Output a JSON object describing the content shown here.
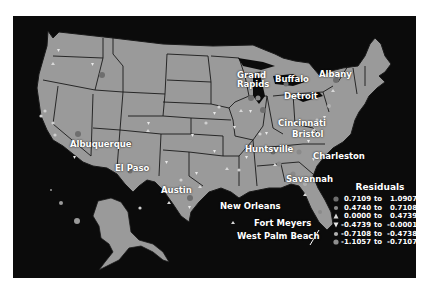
{
  "map": {
    "title": "Residuals map of the United States",
    "colors": {
      "background": "#0b0b0b",
      "land": "#9a9a9a",
      "border": "#1a1a1a",
      "text": "#ffffff"
    },
    "cities": [
      {
        "name": "Grand Rapids",
        "line1": "Grand",
        "line2": "Rapids"
      },
      {
        "name": "Buffalo"
      },
      {
        "name": "Albany"
      },
      {
        "name": "Detroit"
      },
      {
        "name": "Cincinnati"
      },
      {
        "name": "Bristol"
      },
      {
        "name": "Charleston"
      },
      {
        "name": "Huntsville"
      },
      {
        "name": "Savannah"
      },
      {
        "name": "Albuquerque"
      },
      {
        "name": "El Paso"
      },
      {
        "name": "Austin"
      },
      {
        "name": "New Orleans"
      },
      {
        "name": "Fort Meyers"
      },
      {
        "name": "West Palm Beach"
      }
    ]
  },
  "legend": {
    "title": "Residuals",
    "rows": [
      {
        "symbol": "circle-large",
        "color": "#6e6e6e",
        "from": "0.7109",
        "to_label": "to",
        "to": "1.0907"
      },
      {
        "symbol": "circle-medium",
        "color": "#8a8a8a",
        "from": "0.4740",
        "to_label": "to",
        "to": "0.7108"
      },
      {
        "symbol": "triangle-up",
        "color": "#d8d8d8",
        "from": "0.0000",
        "to_label": "to",
        "to": "0.4739"
      },
      {
        "symbol": "triangle-down",
        "color": "#e8e8e8",
        "from": "-0.4739",
        "to_label": "to",
        "to": "-0.0001"
      },
      {
        "symbol": "circle-medium",
        "color": "#b0b0b0",
        "from": "-0.7108",
        "to_label": "to",
        "to": "-0.4738"
      },
      {
        "symbol": "circle-large",
        "color": "#8f8f8f",
        "from": "-1.1057",
        "to_label": "to",
        "to": "-0.7107"
      }
    ]
  }
}
